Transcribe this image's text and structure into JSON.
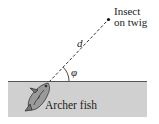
{
  "diagram": {
    "labels": {
      "target_line1": "Insect",
      "target_line2": "on twig",
      "distance": "d",
      "angle": "φ",
      "fish": "Archer fish"
    },
    "colors": {
      "water": "#cfcfcf",
      "surface": "#555555",
      "line": "#333333",
      "text": "#222222"
    }
  }
}
